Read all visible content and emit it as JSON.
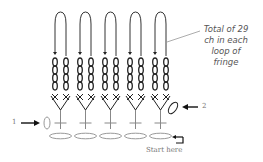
{
  "diagram": {
    "annotation": [
      "Total of 29",
      "ch in each",
      "loop of",
      "fringe"
    ],
    "marker_1": "1",
    "marker_2": "2",
    "start_label": "Start here",
    "fringe_loop_count": 5,
    "colors": {
      "line": "#222222",
      "light": "#999999",
      "text": "#777777"
    }
  }
}
